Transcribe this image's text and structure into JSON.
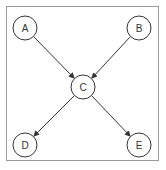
{
  "diagram": {
    "type": "directed-graph",
    "colors": {
      "stroke": "#333333",
      "frame": "#9a9a9a",
      "background": "#ffffff"
    },
    "nodes": [
      {
        "id": "A",
        "label": "A",
        "x": 25,
        "y": 28
      },
      {
        "id": "B",
        "label": "B",
        "x": 139,
        "y": 28
      },
      {
        "id": "C",
        "label": "C",
        "x": 83,
        "y": 87
      },
      {
        "id": "D",
        "label": "D",
        "x": 25,
        "y": 145
      },
      {
        "id": "E",
        "label": "E",
        "x": 139,
        "y": 145
      }
    ],
    "edges": [
      {
        "from": "A",
        "to": "C"
      },
      {
        "from": "B",
        "to": "C"
      },
      {
        "from": "C",
        "to": "D"
      },
      {
        "from": "C",
        "to": "E"
      }
    ]
  }
}
